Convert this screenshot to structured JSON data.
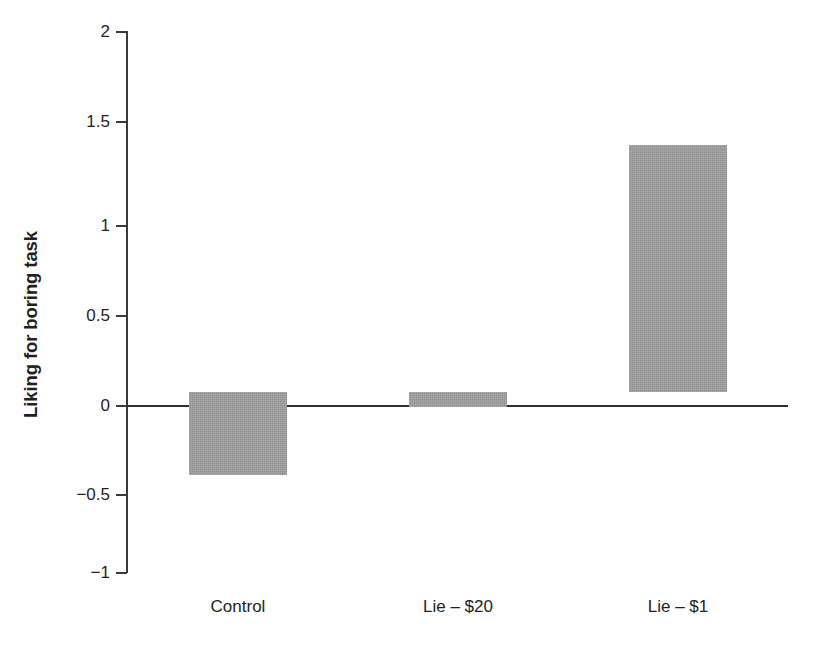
{
  "chart_data": {
    "type": "bar",
    "title": "",
    "xlabel": "",
    "ylabel": "Liking for boring task",
    "categories": [
      "Control",
      "Lie – $20",
      "Lie – $1"
    ],
    "values": [
      -0.46,
      -0.08,
      1.37
    ],
    "ylim": [
      -1,
      2
    ],
    "ytick_labels": [
      "2",
      "1.5",
      "1",
      "0.5",
      "0",
      "−0.5",
      "−1"
    ],
    "ytick_values": [
      2,
      1.5,
      1,
      0.5,
      0,
      -0.5,
      -1
    ],
    "grid": false,
    "legend": false,
    "legend_position": "none",
    "bar_color": "#9e9e9e",
    "axis_color": "#2d2d2d",
    "text_color": "#231f20",
    "background_color": "#ffffff",
    "zero_baseline": true
  }
}
